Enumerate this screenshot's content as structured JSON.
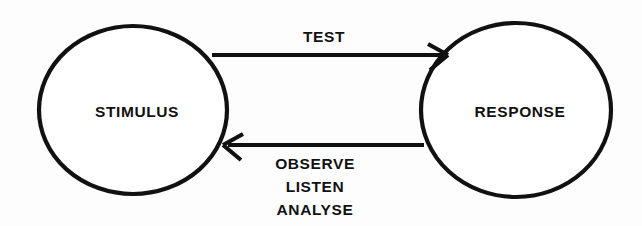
{
  "diagram": {
    "type": "cycle-diagram",
    "background_color": "#fdfdfd",
    "stroke_color": "#111111",
    "text_color": "#111111",
    "nodes": [
      {
        "id": "stimulus",
        "label": "STIMULUS",
        "shape": "ellipse",
        "center_x": 133,
        "center_y": 110,
        "radius_x": 95,
        "radius_y": 85
      },
      {
        "id": "response",
        "label": "RESPONSE",
        "shape": "ellipse",
        "center_x": 516,
        "center_y": 110,
        "radius_x": 96,
        "radius_y": 88
      }
    ],
    "edges": [
      {
        "id": "test",
        "label": "TEST",
        "from": "stimulus",
        "to": "response",
        "direction": "right",
        "y": 55
      },
      {
        "id": "feedback",
        "label": "OBSERVE LISTEN ANALYSE",
        "label_lines": [
          "OBSERVE",
          "LISTEN",
          "ANALYSE"
        ],
        "from": "response",
        "to": "stimulus",
        "direction": "left",
        "y": 145
      }
    ]
  },
  "labels": {
    "stimulus": "STIMULUS",
    "response": "RESPONSE",
    "test": "TEST",
    "observe": "OBSERVE",
    "listen": "LISTEN",
    "analyse": "ANALYSE"
  }
}
